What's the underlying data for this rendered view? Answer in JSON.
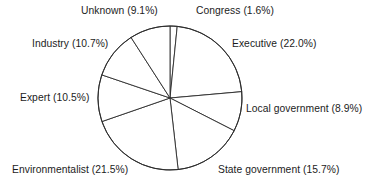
{
  "chart_data": {
    "type": "pie",
    "title": "",
    "subtitle": "",
    "xlabel": "",
    "ylabel": "",
    "legend_position": "none",
    "grid": false,
    "label_format": "{name} ({value}%)",
    "start_angle_deg_from_top": 0,
    "direction": "clockwise",
    "categories": [
      "Congress",
      "Executive",
      "Local government",
      "State government",
      "Environmentalist",
      "Expert",
      "Industry",
      "Unknown"
    ],
    "values": [
      1.6,
      22.0,
      8.9,
      15.7,
      21.5,
      10.5,
      10.7,
      9.1
    ],
    "slices": [
      {
        "name": "Congress",
        "value": 1.6,
        "label": "Congress (1.6%)"
      },
      {
        "name": "Executive",
        "value": 22.0,
        "label": "Executive (22.0%)"
      },
      {
        "name": "Local government",
        "value": 8.9,
        "label": "Local government (8.9%)"
      },
      {
        "name": "State government",
        "value": 15.7,
        "label": "State government (15.7%)"
      },
      {
        "name": "Environmentalist",
        "value": 21.5,
        "label": "Environmentalist (21.5%)"
      },
      {
        "name": "Expert",
        "value": 10.5,
        "label": "Expert (10.5%)"
      },
      {
        "name": "Industry",
        "value": 10.7,
        "label": "Industry (10.7%)"
      },
      {
        "name": "Unknown",
        "value": 9.1,
        "label": "Unknown (9.1%)"
      }
    ],
    "total": 100.0
  },
  "style": {
    "background": "#ffffff",
    "stroke": "#2b2b2b",
    "slice_fill": "#ffffff",
    "text_color": "#1c1c1c"
  },
  "geometry": {
    "center_x": 170,
    "center_y": 98,
    "radius": 72
  }
}
